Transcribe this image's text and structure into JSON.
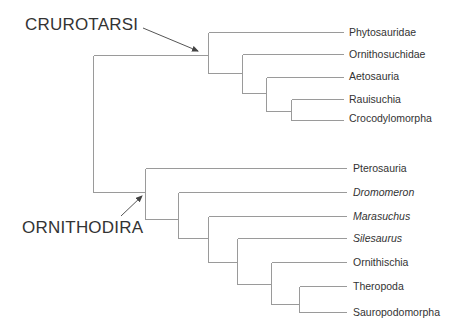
{
  "diagram": {
    "type": "cladogram",
    "clades": [
      {
        "label": "CRUROTARSI",
        "x": 25,
        "y": 15
      },
      {
        "label": "ORNITHODIRA",
        "x": 22,
        "y": 218
      }
    ],
    "taxa": [
      {
        "label": "Phytosauridae",
        "italic": false,
        "y": 32
      },
      {
        "label": "Ornithosuchidae",
        "italic": false,
        "y": 54
      },
      {
        "label": "Aetosauria",
        "italic": false,
        "y": 77
      },
      {
        "label": "Rauisuchia",
        "italic": false,
        "y": 99
      },
      {
        "label": "Crocodylomorpha",
        "italic": false,
        "y": 119
      },
      {
        "label": "Pterosauria",
        "italic": false,
        "y": 168
      },
      {
        "label": "Dromomeron",
        "italic": true,
        "y": 192
      },
      {
        "label": "Marasuchus",
        "italic": true,
        "y": 216
      },
      {
        "label": "Silesaurus",
        "italic": true,
        "y": 238
      },
      {
        "label": "Ornithischia",
        "italic": false,
        "y": 262
      },
      {
        "label": "Theropoda",
        "italic": false,
        "y": 286
      },
      {
        "label": "Sauropodomorpha",
        "italic": false,
        "y": 312
      }
    ],
    "colors": {
      "branch": "#9a9a9a",
      "text": "#333333",
      "arrow": "#555555"
    }
  }
}
